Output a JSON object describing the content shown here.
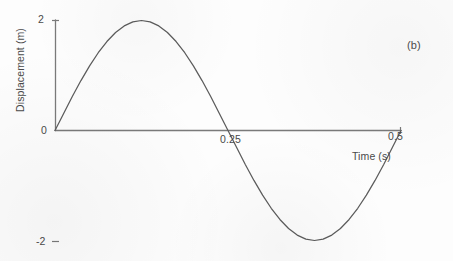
{
  "figure": {
    "panel_label": "(b)",
    "background_color": "#fdfdfd",
    "line_color": "#595959",
    "axis_color": "#777777",
    "text_color": "#4a4a4a"
  },
  "chart_data": {
    "type": "line",
    "title": "",
    "subtitle": "",
    "xlabel": "Time (s)",
    "ylabel": "Displacement (m)",
    "annotations": [
      "(b)"
    ],
    "legend": [],
    "legend_position": "none",
    "grid": false,
    "xlim": [
      0,
      0.5
    ],
    "ylim": [
      -2,
      2
    ],
    "xticks": [
      0.25,
      0.5
    ],
    "xticklabels": [
      "0.25",
      "0.5"
    ],
    "yticks": [
      -2,
      0,
      2
    ],
    "yticklabels": [
      "-2",
      "0",
      "2"
    ],
    "waveform": {
      "amplitude": 2,
      "period": 0.5,
      "phase": 0,
      "equation": "y = 2 sin(2*pi*t / 0.5)"
    },
    "series": [
      {
        "name": "Displacement",
        "color": "#595959",
        "x": [
          0,
          0.0125,
          0.025,
          0.0375,
          0.05,
          0.0625,
          0.075,
          0.0875,
          0.1,
          0.1125,
          0.125,
          0.1375,
          0.15,
          0.1625,
          0.175,
          0.1875,
          0.2,
          0.2125,
          0.225,
          0.2375,
          0.25,
          0.2625,
          0.275,
          0.2875,
          0.3,
          0.3125,
          0.325,
          0.3375,
          0.35,
          0.3625,
          0.375,
          0.3875,
          0.4,
          0.4125,
          0.425,
          0.4375,
          0.45,
          0.4625,
          0.475,
          0.4875,
          0.5
        ],
        "y": [
          0,
          0.309,
          0.618,
          0.908,
          1.176,
          1.414,
          1.618,
          1.782,
          1.902,
          1.975,
          2,
          1.975,
          1.902,
          1.782,
          1.618,
          1.414,
          1.176,
          0.908,
          0.618,
          0.309,
          0,
          -0.309,
          -0.618,
          -0.908,
          -1.176,
          -1.414,
          -1.618,
          -1.782,
          -1.902,
          -1.975,
          -2,
          -1.975,
          -1.902,
          -1.782,
          -1.618,
          -1.414,
          -1.176,
          -0.908,
          -0.618,
          -0.309,
          0
        ]
      }
    ]
  },
  "axes": {
    "y_title": "Displacement (m)",
    "x_title": "Time (s)",
    "y_tick_top": "2",
    "y_tick_zero": "0",
    "y_tick_bottom": "-2",
    "x_tick_mid": "0.25",
    "x_tick_end": "0.5"
  }
}
